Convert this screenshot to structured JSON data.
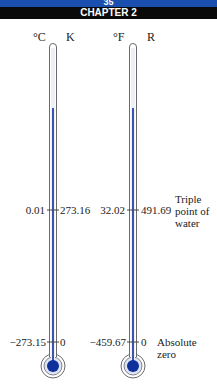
{
  "header": {
    "page_number": "35",
    "chapter": "CHAPTER 2"
  },
  "thermometers": [
    {
      "left_unit": "°C",
      "right_unit": "K",
      "triple_point": {
        "left": "0.01",
        "right": "273.16"
      },
      "absolute_zero": {
        "left": "−273.15",
        "right": "0"
      }
    },
    {
      "left_unit": "°F",
      "right_unit": "R",
      "triple_point": {
        "left": "32.02",
        "right": "491.69"
      },
      "absolute_zero": {
        "left": "−459.67",
        "right": "0"
      }
    }
  ],
  "annotations": {
    "triple_point": [
      "Triple",
      "point of",
      "water"
    ],
    "absolute_zero": [
      "Absolute",
      "zero"
    ]
  },
  "colors": {
    "header_blue": "#1a4fb0",
    "header_black": "#0a0a0a",
    "mercury": "#3a55b0",
    "bulb": "#0f2f9c",
    "outline": "#6a6a6a"
  }
}
